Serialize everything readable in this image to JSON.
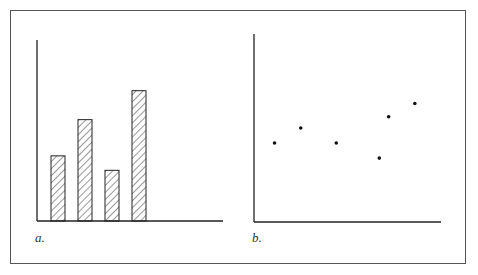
{
  "panels": [
    {
      "id": "a",
      "label": "a.",
      "type": "bar"
    },
    {
      "id": "b",
      "label": "b.",
      "type": "scatter"
    }
  ],
  "chart_data": [
    {
      "type": "bar",
      "title": "",
      "annotation": "a.",
      "xlabel": "",
      "ylabel": "",
      "categories": [
        "1",
        "2",
        "3",
        "4"
      ],
      "values": [
        36,
        56,
        28,
        72
      ],
      "ylim": [
        0,
        100
      ],
      "grid": false,
      "fill": "diagonal-hatch"
    },
    {
      "type": "scatter",
      "title": "",
      "annotation": "b.",
      "xlabel": "",
      "ylabel": "",
      "x": [
        11,
        25,
        44,
        67,
        72,
        86
      ],
      "y": [
        42,
        50,
        42,
        34,
        56,
        63
      ],
      "xlim": [
        0,
        100
      ],
      "ylim": [
        0,
        100
      ],
      "grid": false
    }
  ]
}
